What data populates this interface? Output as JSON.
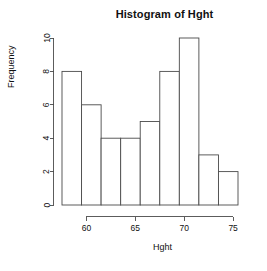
{
  "chart_data": {
    "type": "bar",
    "title": "Histogram of Hght",
    "xlabel": "Hght",
    "ylabel": "Frequency",
    "categories": [
      "57.5-59.5",
      "59.5-61.5",
      "61.5-63.5",
      "63.5-65.5",
      "65.5-67.5",
      "67.5-69.5",
      "69.5-71.5",
      "71.5-73.5",
      "73.5-75.5"
    ],
    "bin_edges": [
      57.5,
      59.5,
      61.5,
      63.5,
      65.5,
      67.5,
      69.5,
      71.5,
      73.5,
      75.5
    ],
    "values": [
      8,
      6,
      4,
      4,
      5,
      8,
      10,
      3,
      2
    ],
    "xlim": [
      57.5,
      75.5
    ],
    "ylim": [
      0,
      10
    ],
    "x_ticks": [
      60,
      65,
      70,
      75
    ],
    "x_tick_labels": [
      "60",
      "65",
      "70",
      "75"
    ],
    "y_ticks": [
      0,
      2,
      4,
      6,
      8,
      10
    ],
    "y_tick_labels": [
      "0",
      "2",
      "4",
      "6",
      "8",
      "10"
    ],
    "grid": false,
    "legend": false,
    "bar_fill_color": "#ffffff",
    "bar_stroke_color": "#4a4a4a",
    "axis_color": "#4a4a4a",
    "text_color": "#111111",
    "background_color": "#ffffff"
  }
}
